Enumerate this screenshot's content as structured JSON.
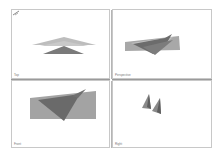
{
  "layout": "four-viewport",
  "viewports": [
    {
      "id": "top",
      "label": "Top",
      "active": false
    },
    {
      "id": "perspective",
      "label": "Perspective",
      "active": false
    },
    {
      "id": "front",
      "label": "Front",
      "active": false
    },
    {
      "id": "right",
      "label": "Right",
      "active": false
    }
  ],
  "colors": {
    "background": "#ffffff",
    "viewport_border": "#c8c8c8",
    "separator": "#9a9a9a",
    "shape_light": "#b4b4b4",
    "shape_mid": "#9c9c9c",
    "shape_dark": "#6e6e6e"
  },
  "icons": {
    "axis_gizmo": "axis-gizmo-icon"
  }
}
